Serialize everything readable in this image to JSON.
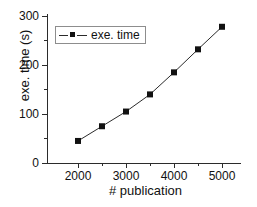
{
  "chart_data": {
    "type": "line",
    "title": "",
    "xlabel": "# publication",
    "ylabel": "exe. time (s)",
    "x": [
      2000,
      2500,
      3000,
      3500,
      4000,
      4500,
      5000
    ],
    "series": [
      {
        "name": "exe. time",
        "values": [
          45,
          75,
          105,
          140,
          185,
          232,
          278
        ],
        "marker": "square",
        "color": "#111111"
      }
    ],
    "xlim": [
      1750,
      5250
    ],
    "ylim": [
      0,
      300
    ],
    "xticks": [
      2000,
      3000,
      4000,
      5000
    ],
    "xticklabels": [
      "2000",
      "3000",
      "4000",
      "5000"
    ],
    "xminorticks": [
      2500,
      3500,
      4500
    ],
    "yticks": [
      0,
      100,
      200,
      300
    ],
    "yticklabels": [
      "0",
      "100",
      "200",
      "300"
    ],
    "yminorticks": [
      50,
      150,
      250
    ],
    "grid": false,
    "legend": {
      "position": "upper left",
      "entries": [
        "exe. time"
      ]
    }
  },
  "legend": {
    "entry_label": "exe. time"
  },
  "axes": {
    "x_title": "# publication",
    "y_title": "exe. time (s)",
    "x_tick_labels": [
      "2000",
      "3000",
      "4000",
      "5000"
    ],
    "y_tick_labels": [
      "300",
      "200",
      "100",
      "0"
    ]
  },
  "colors": {
    "line": "#2b2b2b",
    "marker": "#111111",
    "axis": "#2b2b2b",
    "legend_border": "#8d8d8d",
    "background": "#ffffff"
  }
}
